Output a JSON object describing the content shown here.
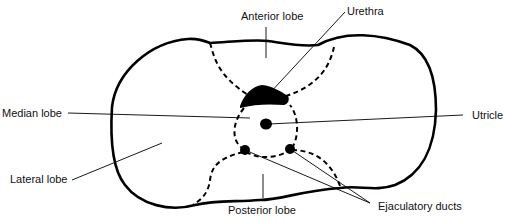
{
  "diagram": {
    "labels": {
      "anterior_lobe": "Anterior lobe",
      "urethra": "Urethra",
      "median_lobe": "Median lobe",
      "utricle": "Utricle",
      "lateral_lobe": "Lateral lobe",
      "posterior_lobe": "Posterior lobe",
      "ejaculatory_ducts": "Ejaculatory ducts"
    },
    "colors": {
      "line": "#000000",
      "background": "#ffffff",
      "text": "#111111"
    }
  }
}
